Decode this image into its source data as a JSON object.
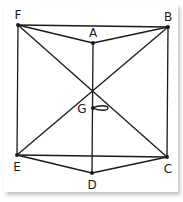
{
  "diagram": {
    "points": {
      "F": {
        "label": "F",
        "x": 18,
        "y": 25,
        "lx": 18,
        "ly": 18
      },
      "B": {
        "label": "B",
        "x": 168,
        "y": 27,
        "lx": 168,
        "ly": 20
      },
      "A": {
        "label": "A",
        "x": 93,
        "y": 43,
        "lx": 93,
        "ly": 36
      },
      "G": {
        "label": "G",
        "x": 93,
        "y": 108,
        "lx": 80,
        "ly": 112
      },
      "E": {
        "label": "E",
        "x": 17,
        "y": 155,
        "lx": 17,
        "ly": 170
      },
      "C": {
        "label": "C",
        "x": 167,
        "y": 157,
        "lx": 168,
        "ly": 172
      },
      "D": {
        "label": "D",
        "x": 92,
        "y": 173,
        "lx": 92,
        "ly": 188
      }
    },
    "edges": [
      [
        "F",
        "B"
      ],
      [
        "F",
        "A"
      ],
      [
        "A",
        "B"
      ],
      [
        "F",
        "E"
      ],
      [
        "B",
        "C"
      ],
      [
        "F",
        "C"
      ],
      [
        "B",
        "E"
      ],
      [
        "A",
        "D"
      ],
      [
        "E",
        "C"
      ],
      [
        "E",
        "D"
      ],
      [
        "D",
        "C"
      ]
    ],
    "stroke_color": "#1a1a1a"
  }
}
